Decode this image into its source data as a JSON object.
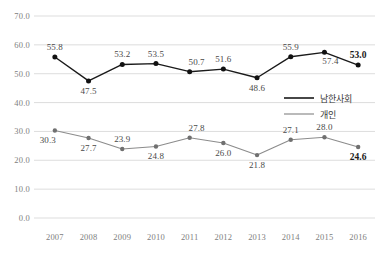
{
  "chart_data": {
    "type": "line",
    "title": "",
    "subtitle": "",
    "xlabel": "",
    "ylabel": "",
    "categories": [
      "2007",
      "2008",
      "2009",
      "2010",
      "2011",
      "2012",
      "2013",
      "2014",
      "2015",
      "2016"
    ],
    "ylim": [
      0.0,
      70.0
    ],
    "ytick_labels": [
      "70.0",
      "60.0",
      "50.0",
      "40.0",
      "30.0",
      "20.0",
      "10.0",
      "0.0"
    ],
    "ytick_values": [
      70.0,
      60.0,
      50.0,
      40.0,
      30.0,
      20.0,
      10.0,
      0.0
    ],
    "grid": true,
    "legend_position": "right-middle",
    "series": [
      {
        "name": "남한사회",
        "color": "#1a1a1a",
        "values": [
          55.8,
          47.5,
          53.2,
          53.5,
          50.7,
          51.6,
          48.6,
          55.9,
          57.4,
          53.0
        ],
        "labels": [
          "55.8",
          "47.5",
          "53.2",
          "53.5",
          "50.7",
          "51.6",
          "48.6",
          "55.9",
          "57.4",
          "53.0"
        ],
        "label_positions": [
          "above",
          "below",
          "above",
          "above",
          "above-right",
          "above",
          "below",
          "above",
          "below-right",
          "above"
        ],
        "emphasis_last": true
      },
      {
        "name": "개인",
        "color": "#8c8c8c",
        "values": [
          30.3,
          27.7,
          23.9,
          24.8,
          27.8,
          26.0,
          21.8,
          27.1,
          28.0,
          24.6
        ],
        "labels": [
          "30.3",
          "27.7",
          "23.9",
          "24.8",
          "27.8",
          "26.0",
          "21.8",
          "27.1",
          "28.0",
          "24.6"
        ],
        "label_positions": [
          "below-left",
          "below",
          "above",
          "below",
          "above-right",
          "below",
          "below",
          "above",
          "above",
          "below"
        ],
        "emphasis_last": true
      }
    ]
  },
  "legend": {
    "items": [
      {
        "label": "남한사회",
        "color": "#1a1a1a"
      },
      {
        "label": "개인",
        "color": "#8c8c8c"
      }
    ]
  },
  "colors": {
    "series_dark": "#1a1a1a",
    "series_gray": "#8c8c8c",
    "gridline": "#d9d9d9",
    "tick_text": "#808080",
    "label_text": "#4a4a4a",
    "background": "#ffffff"
  }
}
